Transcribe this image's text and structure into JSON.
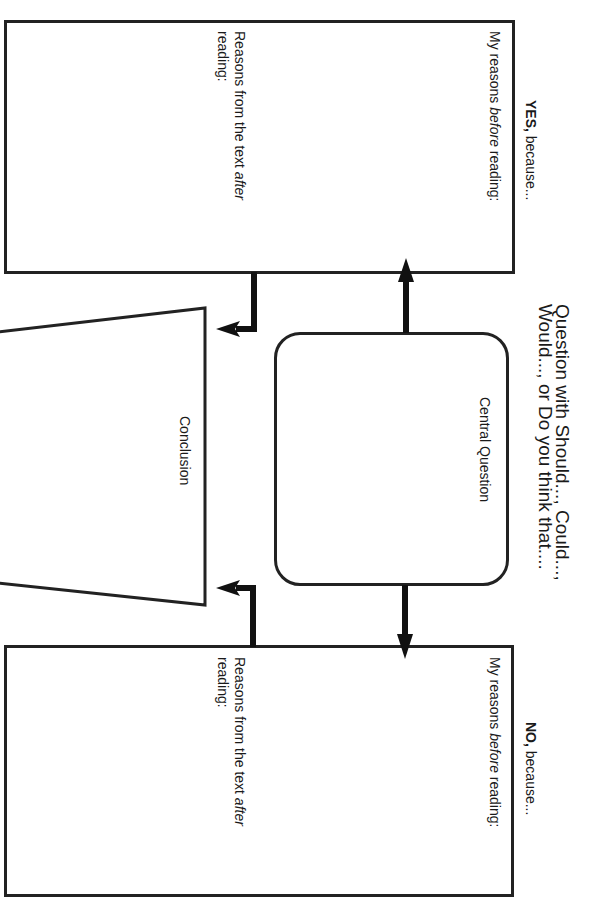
{
  "worksheet": {
    "orientation": "rotated-90-clockwise",
    "question_prompt": {
      "line1": "Question with Should..., Could...,",
      "line2": "Would..., or Do you think that...."
    },
    "yes_box": {
      "heading_strong": "YES,",
      "heading_rest": " because...",
      "before_prefix": "My reasons ",
      "before_emphasis": "before",
      "before_suffix": " reading:",
      "after_prefix": "Reasons from the text ",
      "after_emphasis": "after",
      "after_line2": "reading:"
    },
    "central_box": {
      "label": "Central Question"
    },
    "conclusion_box": {
      "label": "Conclusion"
    },
    "no_box": {
      "heading_strong": "NO,",
      "heading_rest": " because...",
      "before_prefix": "My reasons ",
      "before_emphasis": "before",
      "before_suffix": " reading:",
      "after_prefix": "Reasons from the text ",
      "after_emphasis": "after",
      "after_line2": "reading:"
    },
    "colors": {
      "line": "#222222",
      "background": "#ffffff",
      "text": "#1a1a1a"
    }
  }
}
